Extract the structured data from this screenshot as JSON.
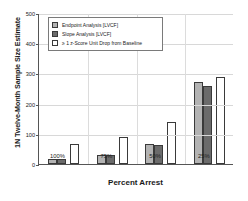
{
  "chart_data": {
    "type": "bar",
    "title": "",
    "xlabel": "Percent Arrest",
    "ylabel": "1N Twelve-Month Sample Size Estimate",
    "categories": [
      "100%",
      "75%",
      "50%",
      "25%"
    ],
    "ylim": [
      0,
      500
    ],
    "yticks": [
      0,
      100,
      200,
      300,
      400,
      500
    ],
    "ytick_labels": [
      "0",
      "100",
      "200",
      "300",
      "400",
      "500"
    ],
    "grid": true,
    "legend_position": "top-left",
    "series": [
      {
        "name": "Endpoint Analysis [LVCF]",
        "color": "#b3b3b3",
        "values": [
          18,
          30,
          65,
          272
        ]
      },
      {
        "name": "Slope Analysis [LVCF]",
        "color": "#6b6b6b",
        "values": [
          18,
          29,
          62,
          258
        ]
      },
      {
        "name": "≥ 1 z-Score Unit Drop from Baseline",
        "color": "#ffffff",
        "values": [
          66,
          90,
          140,
          288
        ]
      }
    ]
  },
  "axes": {
    "y_title": "1N Twelve-Month Sample Size Estimate",
    "x_title": "Percent Arrest"
  }
}
